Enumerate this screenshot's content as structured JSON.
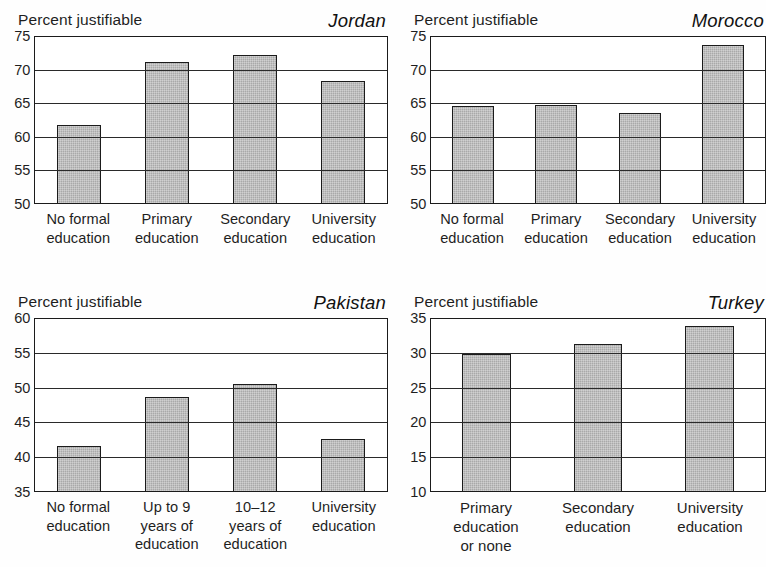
{
  "figure": {
    "background_color": "#ffffff",
    "bar_fill_color": "#a9a9a9",
    "bar_outline_color": "#1b1b1b",
    "axis_color": "#1b1b1b"
  },
  "panels": {
    "jordan": {
      "country": "Jordan",
      "caption": "Percent justifiable"
    },
    "morocco": {
      "country": "Morocco",
      "caption": "Percent justifiable"
    },
    "pakistan": {
      "country": "Pakistan",
      "caption": "Percent justifiable"
    },
    "turkey": {
      "country": "Turkey",
      "caption": "Percent justifiable"
    }
  },
  "chart_data": [
    {
      "type": "bar",
      "title": "Jordan",
      "ylabel": "Percent justifiable",
      "xlabel": "",
      "categories": [
        "No formal\neducation",
        "Primary\neducation",
        "Secondary\neducation",
        "University\neducation"
      ],
      "values": [
        61.7,
        71.3,
        72.3,
        68.4
      ],
      "ylim": [
        50,
        75
      ],
      "yticks": [
        50,
        55,
        60,
        65,
        70,
        75
      ],
      "ytick_labels": [
        "50",
        "55",
        "60",
        "65",
        "70",
        "75"
      ],
      "grid": true,
      "legend": false
    },
    {
      "type": "bar",
      "title": "Morocco",
      "ylabel": "Percent justifiable",
      "xlabel": "",
      "categories": [
        "No formal\neducation",
        "Primary\neducation",
        "Secondary\neducation",
        "University\neducation"
      ],
      "values": [
        64.6,
        64.7,
        63.6,
        73.8
      ],
      "ylim": [
        50,
        75
      ],
      "yticks": [
        50,
        55,
        60,
        65,
        70,
        75
      ],
      "ytick_labels": [
        "50",
        "55",
        "60",
        "65",
        "70",
        "75"
      ],
      "grid": true,
      "legend": false
    },
    {
      "type": "bar",
      "title": "Pakistan",
      "ylabel": "Percent justifiable",
      "xlabel": "",
      "categories": [
        "No formal\neducation",
        "Up to 9\nyears of\neducation",
        "10–12\nyears of\neducation",
        "University\neducation"
      ],
      "values": [
        41.5,
        48.6,
        50.6,
        42.6
      ],
      "ylim": [
        35,
        60
      ],
      "yticks": [
        35,
        40,
        45,
        50,
        55,
        60
      ],
      "ytick_labels": [
        "35",
        "40",
        "45",
        "50",
        "55",
        "60"
      ],
      "grid": true,
      "legend": false
    },
    {
      "type": "bar",
      "title": "Turkey",
      "ylabel": "Percent justifiable",
      "xlabel": "",
      "categories": [
        "Primary\neducation\nor none",
        "Secondary\neducation",
        "University\neducation"
      ],
      "values": [
        29.9,
        31.4,
        34.0
      ],
      "ylim": [
        10,
        35
      ],
      "yticks": [
        10,
        15,
        20,
        25,
        30,
        35
      ],
      "ytick_labels": [
        "10",
        "15",
        "20",
        "25",
        "30",
        "35"
      ],
      "grid": true,
      "legend": false
    }
  ]
}
